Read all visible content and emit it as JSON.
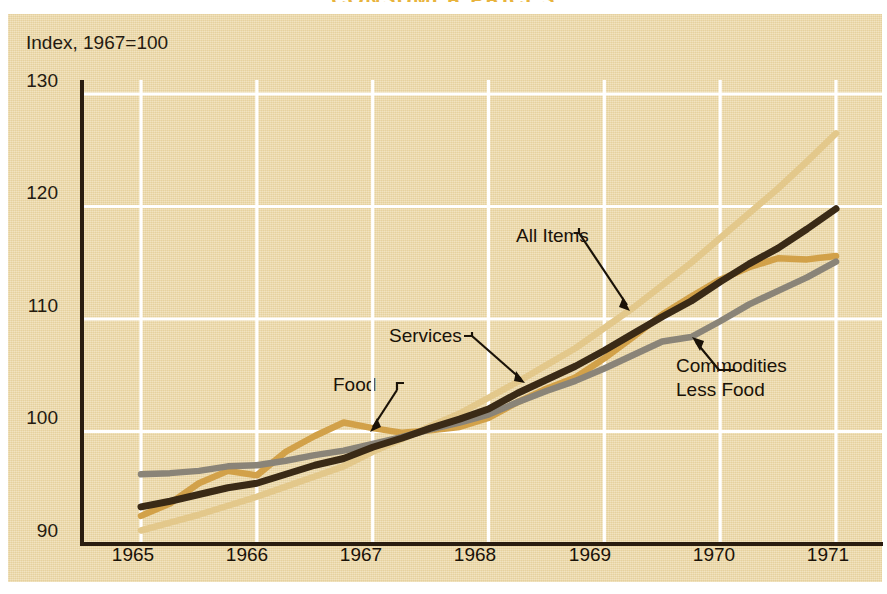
{
  "headline": "CONSUMER PRICES",
  "axis": {
    "y_title": "Index, 1967=100",
    "y_ticks": [
      "90",
      "100",
      "110",
      "120",
      "130"
    ],
    "x_ticks": [
      "1965",
      "1966",
      "1967",
      "1968",
      "1969",
      "1970",
      "1971"
    ]
  },
  "annotations": {
    "all_items": "All Items",
    "services": "Services",
    "food": "Food",
    "commodities": "Commodities\nLess Food",
    "commodities_line1": "Commodities",
    "commodities_line2": "Less Food"
  },
  "colors": {
    "background": "#ecd9a8",
    "headline": "#e8b33c",
    "axis": "#2a1d10",
    "gridline": "#ffffff",
    "all_items": "#3a2a16",
    "food": "#d2a149",
    "services": "#e3c88b",
    "commodities_less_food": "#8a8478"
  },
  "chart_data": {
    "type": "line",
    "title": "CONSUMER PRICES",
    "xlabel": "",
    "ylabel": "Index, 1967=100",
    "xlim": [
      1965,
      1971
    ],
    "ylim": [
      90,
      130
    ],
    "grid": true,
    "legend": "annotated-inline",
    "x": [
      1965.0,
      1965.25,
      1965.5,
      1965.75,
      1966.0,
      1966.25,
      1966.5,
      1966.75,
      1967.0,
      1967.25,
      1967.5,
      1967.75,
      1968.0,
      1968.25,
      1968.5,
      1968.75,
      1969.0,
      1969.25,
      1969.5,
      1969.75,
      1970.0,
      1970.25,
      1970.5,
      1970.75,
      1971.0
    ],
    "series": [
      {
        "name": "All Items",
        "color": "#3a2a16",
        "values": [
          93.3,
          93.8,
          94.4,
          95.0,
          95.4,
          96.2,
          97.0,
          97.6,
          98.6,
          99.4,
          100.3,
          101.1,
          102.0,
          103.4,
          104.6,
          105.8,
          107.2,
          108.7,
          110.2,
          111.6,
          113.3,
          114.9,
          116.3,
          118.0,
          119.8
        ]
      },
      {
        "name": "Food",
        "color": "#d2a149",
        "values": [
          92.5,
          93.6,
          95.4,
          96.5,
          96.1,
          98.2,
          99.6,
          100.8,
          100.3,
          99.9,
          100.1,
          100.4,
          101.2,
          102.6,
          103.8,
          104.8,
          106.5,
          108.4,
          110.4,
          112.0,
          113.5,
          114.6,
          115.4,
          115.3,
          115.6
        ]
      },
      {
        "name": "Services",
        "color": "#e3c88b",
        "values": [
          91.2,
          91.9,
          92.6,
          93.4,
          94.2,
          95.1,
          96.0,
          96.9,
          98.2,
          99.3,
          100.5,
          101.6,
          103.0,
          104.4,
          105.9,
          107.4,
          109.2,
          111.0,
          113.0,
          115.0,
          117.2,
          119.4,
          121.6,
          124.0,
          126.5
        ]
      },
      {
        "name": "Commodities Less Food",
        "color": "#8a8478",
        "values": [
          96.2,
          96.3,
          96.5,
          96.9,
          97.0,
          97.4,
          97.9,
          98.3,
          98.9,
          99.5,
          100.2,
          100.8,
          101.5,
          102.6,
          103.6,
          104.5,
          105.6,
          106.8,
          108.0,
          108.4,
          109.8,
          111.3,
          112.5,
          113.7,
          115.1
        ]
      }
    ]
  }
}
